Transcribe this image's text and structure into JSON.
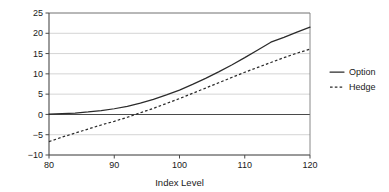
{
  "chart_data": {
    "type": "line",
    "title": "",
    "xlabel": "Index Level",
    "ylabel": "",
    "xlim": [
      80,
      120
    ],
    "ylim": [
      -10,
      25
    ],
    "xticks": [
      80,
      90,
      100,
      110,
      120
    ],
    "yticks": [
      -10,
      -5,
      0,
      5,
      10,
      15,
      20,
      25
    ],
    "xtick_labels": [
      "80",
      "90",
      "100",
      "110",
      "120"
    ],
    "ytick_labels": [
      "-10",
      "-5",
      "0",
      "5",
      "10",
      "15",
      "20",
      "25"
    ],
    "grid": "horizontal",
    "legend_position": "right",
    "x": [
      80,
      82,
      84,
      86,
      88,
      90,
      92,
      94,
      96,
      98,
      100,
      102,
      104,
      106,
      108,
      110,
      112,
      114,
      116,
      118,
      120
    ],
    "series": [
      {
        "name": "Option",
        "style": "solid",
        "color": "#2b2b2b",
        "values": [
          0.1,
          0.2,
          0.35,
          0.6,
          0.95,
          1.4,
          2.0,
          2.8,
          3.7,
          4.8,
          6.0,
          7.4,
          8.9,
          10.5,
          12.2,
          14.0,
          15.9,
          17.8,
          19.0,
          20.3,
          21.5
        ]
      },
      {
        "name": "Hedge",
        "style": "dashed",
        "color": "#2b2b2b",
        "values": [
          -6.7,
          -5.6,
          -4.6,
          -3.6,
          -2.6,
          -1.7,
          -0.7,
          0.4,
          1.5,
          2.7,
          3.9,
          5.2,
          6.5,
          7.8,
          9.1,
          10.4,
          11.6,
          12.8,
          14.0,
          15.1,
          16.1
        ]
      }
    ]
  },
  "legend": {
    "items": [
      {
        "label": "Option",
        "style": "solid"
      },
      {
        "label": "Hedge",
        "style": "dashed"
      }
    ]
  },
  "axes": {
    "x_title": "Index Level"
  },
  "colors": {
    "background": "#ffffff",
    "grid": "#c9c9c9",
    "axis": "#4a4a4a",
    "series": "#2b2b2b"
  }
}
